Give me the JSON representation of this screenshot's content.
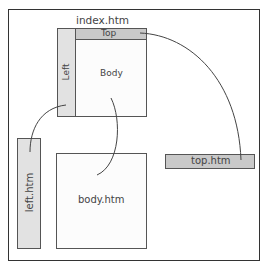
{
  "diagram": {
    "frameset": {
      "title": "index.htm",
      "regions": {
        "top": "Top",
        "left": "Left",
        "body": "Body"
      }
    },
    "files": {
      "left": "left.htm",
      "body": "body.htm",
      "top": "top.htm"
    },
    "connections": [
      {
        "from": "Top",
        "to": "top.htm"
      },
      {
        "from": "Left",
        "to": "left.htm"
      },
      {
        "from": "Body",
        "to": "body.htm"
      }
    ],
    "colors": {
      "region_fill": "#c9c9c9",
      "left_fill": "#e2e2e2",
      "stroke": "#444444"
    }
  }
}
